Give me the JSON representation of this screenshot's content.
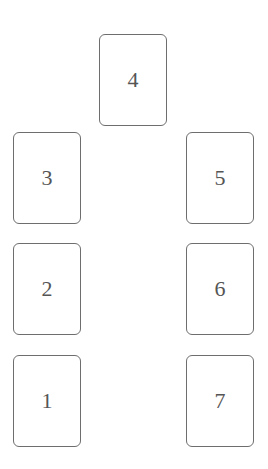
{
  "spread": {
    "card_count": 7,
    "layout": "horseshoe",
    "border_color": "#6e6e6e",
    "text_color": "#555555",
    "cards": [
      {
        "position": "1",
        "label": "1"
      },
      {
        "position": "2",
        "label": "2"
      },
      {
        "position": "3",
        "label": "3"
      },
      {
        "position": "4",
        "label": "4"
      },
      {
        "position": "5",
        "label": "5"
      },
      {
        "position": "6",
        "label": "6"
      },
      {
        "position": "7",
        "label": "7"
      }
    ]
  }
}
